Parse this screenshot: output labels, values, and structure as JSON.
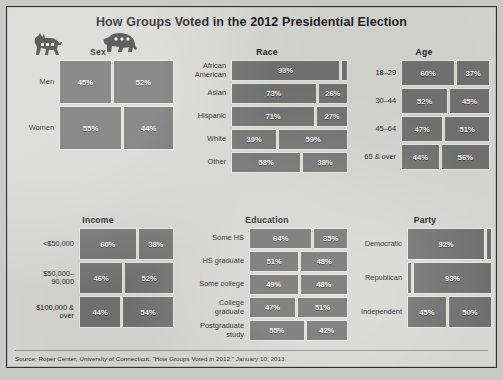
{
  "title": "How Groups Voted in the 2012 Presidential Election",
  "source": "Source: Roper Center, University of Connecticut. \"How Groups Voted in 2012.\" January 10, 2013.",
  "legend": {
    "democrat_icon": "donkey-icon",
    "republican_icon": "elephant-icon"
  },
  "colors": {
    "paper": "#d6d6d2",
    "bar": "#6f6f6f",
    "bar_outline": "#e8e8e4",
    "text": "#17171a",
    "bar_text": "#f2f2ef"
  },
  "chart_data": {
    "type": "bar",
    "title": "How Groups Voted in the 2012 Presidential Election",
    "orientation": "horizontal",
    "series": [
      {
        "name": "Democrat",
        "icon": "donkey-icon"
      },
      {
        "name": "Republican",
        "icon": "elephant-icon"
      }
    ],
    "value_unit": "percent",
    "xlim": [
      0,
      100
    ],
    "grid": false,
    "legend_position": "top-left",
    "panels": [
      {
        "id": "sex",
        "label": "Sex",
        "categories": [
          "Men",
          "Women"
        ],
        "rows": [
          {
            "category": "Men",
            "dem": 45,
            "rep": 52,
            "dem_label": "45%",
            "rep_label": "52%"
          },
          {
            "category": "Women",
            "dem": 55,
            "rep": 44,
            "dem_label": "55%",
            "rep_label": "44%"
          }
        ]
      },
      {
        "id": "race",
        "label": "Race",
        "categories": [
          "African American",
          "Asian",
          "Hispanic",
          "White",
          "Other"
        ],
        "rows": [
          {
            "category": "African\nAmerican",
            "dem": 93,
            "rep": 6,
            "dem_label": "93%",
            "rep_label": ""
          },
          {
            "category": "Asian",
            "dem": 73,
            "rep": 26,
            "dem_label": "73%",
            "rep_label": "26%"
          },
          {
            "category": "Hispanic",
            "dem": 71,
            "rep": 27,
            "dem_label": "71%",
            "rep_label": "27%"
          },
          {
            "category": "White",
            "dem": 39,
            "rep": 59,
            "dem_label": "39%",
            "rep_label": "59%"
          },
          {
            "category": "Other",
            "dem": 58,
            "rep": 38,
            "dem_label": "58%",
            "rep_label": "38%"
          }
        ]
      },
      {
        "id": "age",
        "label": "Age",
        "categories": [
          "18–29",
          "30–44",
          "45–64",
          "65 & over"
        ],
        "rows": [
          {
            "category": "18–29",
            "dem": 60,
            "rep": 37,
            "dem_label": "60%",
            "rep_label": "37%"
          },
          {
            "category": "30–44",
            "dem": 52,
            "rep": 45,
            "dem_label": "52%",
            "rep_label": "45%"
          },
          {
            "category": "45–64",
            "dem": 47,
            "rep": 51,
            "dem_label": "47%",
            "rep_label": "51%"
          },
          {
            "category": "65 & over",
            "dem": 44,
            "rep": 56,
            "dem_label": "44%",
            "rep_label": "56%"
          }
        ]
      },
      {
        "id": "income",
        "label": "Income",
        "categories": [
          "<$50,000",
          "$50,000–90,000",
          "$100,000 & over"
        ],
        "rows": [
          {
            "category": "<$50,000",
            "dem": 60,
            "rep": 38,
            "dem_label": "60%",
            "rep_label": "38%"
          },
          {
            "category": "$50,000–\n90,000",
            "dem": 46,
            "rep": 52,
            "dem_label": "46%",
            "rep_label": "52%"
          },
          {
            "category": "$100,000 &\nover",
            "dem": 44,
            "rep": 54,
            "dem_label": "44%",
            "rep_label": "54%"
          }
        ]
      },
      {
        "id": "education",
        "label": "Education",
        "categories": [
          "Some HS",
          "HS graduate",
          "Some college",
          "College graduate",
          "Postgraduate study"
        ],
        "rows": [
          {
            "category": "Some HS",
            "dem": 64,
            "rep": 35,
            "dem_label": "64%",
            "rep_label": "35%"
          },
          {
            "category": "HS graduate",
            "dem": 51,
            "rep": 48,
            "dem_label": "51%",
            "rep_label": "48%"
          },
          {
            "category": "Some college",
            "dem": 49,
            "rep": 48,
            "dem_label": "49%",
            "rep_label": "48%"
          },
          {
            "category": "College\ngraduate",
            "dem": 47,
            "rep": 51,
            "dem_label": "47%",
            "rep_label": "51%"
          },
          {
            "category": "Postgraduate\nstudy",
            "dem": 55,
            "rep": 42,
            "dem_label": "55%",
            "rep_label": "42%"
          }
        ]
      },
      {
        "id": "party",
        "label": "Party",
        "categories": [
          "Democratic",
          "Republican",
          "Independent"
        ],
        "rows": [
          {
            "category": "Democratic",
            "dem": 92,
            "rep": 7,
            "dem_label": "92%",
            "rep_label": "",
            "align": "left"
          },
          {
            "category": "Republican",
            "dem": 6,
            "rep": 93,
            "dem_label": "",
            "rep_label": "93%",
            "align": "right"
          },
          {
            "category": "Independent",
            "dem": 45,
            "rep": 50,
            "dem_label": "45%",
            "rep_label": "50%"
          }
        ]
      }
    ]
  }
}
